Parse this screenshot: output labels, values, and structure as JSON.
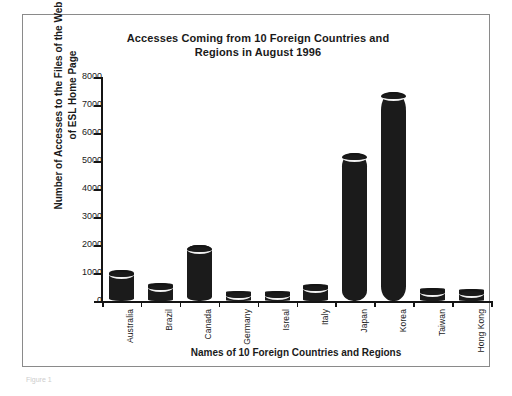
{
  "figure": {
    "caption": "Figure 1"
  },
  "chart_data": {
    "type": "bar",
    "title": "Accesses Coming from 10 Foreign Countries and Regions in August 1996",
    "title_line1": "Accesses Coming from 10 Foreign Countries and",
    "title_line2": "Regions in August 1996",
    "xlabel": "Names of 10 Foreign Countries and Regions",
    "ylabel": "Number of Accesses to the Files of the Web Site of ESL Home Page",
    "ylabel_line1": "Number of Accesses to the Files of the Web Site",
    "ylabel_line2": "of ESL Home Page",
    "categories": [
      "Australia",
      "Brazil",
      "Canada",
      "Germany",
      "Isreal",
      "Italy",
      "Japan",
      "Korea",
      "Taiwan",
      "Hong Kong"
    ],
    "values": [
      1100,
      650,
      2000,
      330,
      330,
      600,
      5300,
      7450,
      450,
      420
    ],
    "ylim": [
      0,
      8000
    ],
    "yticks": [
      0,
      1000,
      2000,
      3000,
      4000,
      5000,
      6000,
      7000,
      8000
    ],
    "ytick_labels": [
      "0",
      "1000",
      "2000",
      "3000",
      "4000",
      "5000",
      "6000",
      "7000",
      "8000"
    ],
    "grid": false,
    "legend": "none",
    "bar_style": "3d-cylinder",
    "bar_color": "#1b1b1b",
    "axis_color": "#141414",
    "text_color": "#1a1a1a"
  }
}
